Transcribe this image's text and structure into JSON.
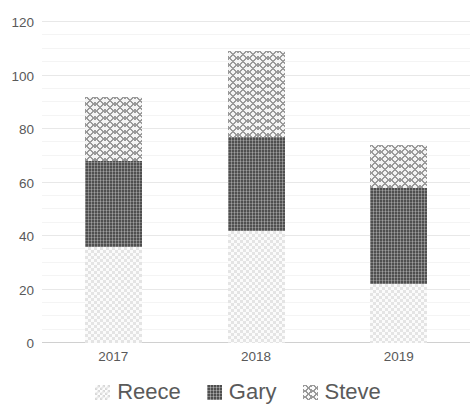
{
  "chart_data": {
    "type": "bar",
    "subtype": "stacked-column",
    "title": "",
    "subtitle": "",
    "xlabel": "",
    "ylabel": "",
    "categories": [
      "2017",
      "2018",
      "2019"
    ],
    "series": [
      {
        "name": "Reece",
        "values": [
          36,
          42,
          22
        ],
        "pattern": "light-checker",
        "color": "#fbfbfb"
      },
      {
        "name": "Gary",
        "values": [
          32,
          35,
          36
        ],
        "pattern": "dark-crosshatch",
        "color": "#4f4f4f"
      },
      {
        "name": "Steve",
        "values": [
          24,
          32,
          16
        ],
        "pattern": "wave-zigzag",
        "color": "#9a9a9a"
      }
    ],
    "totals": [
      92,
      109,
      74
    ],
    "ylim": [
      0,
      120
    ],
    "yticks": [
      0,
      20,
      40,
      60,
      80,
      100,
      120
    ],
    "minor_gridlines": true,
    "grid": true,
    "legend_position": "bottom"
  },
  "axes": {
    "y_tick_labels": [
      "120",
      "100",
      "80",
      "60",
      "40",
      "20",
      "0"
    ],
    "x_tick_labels": [
      "2017",
      "2018",
      "2019"
    ]
  },
  "legend": {
    "items": [
      {
        "label": "Reece"
      },
      {
        "label": "Gary"
      },
      {
        "label": "Steve"
      }
    ]
  },
  "colors": {
    "gridline": "#e8e8e8",
    "axis": "#d0d0d0",
    "text": "#595959",
    "gary_fill": "#4f4f4f",
    "steve_fill": "#9a9a9a",
    "reece_fill": "#fbfbfb"
  }
}
